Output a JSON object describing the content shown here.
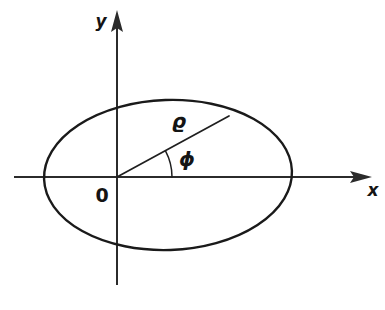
{
  "figure": {
    "kind": "geometry-diagram",
    "background_color": "#ffffff",
    "ink_color": "#1a1a1a"
  },
  "axes": {
    "x_axis": {
      "label": "x",
      "arrow_direction": "right",
      "start_x": 14,
      "end_x": 372,
      "y": 177
    },
    "y_axis": {
      "label": "y",
      "arrow_direction": "up",
      "start_y": 285,
      "end_y": 10,
      "x": 117
    },
    "origin_label": "0"
  },
  "ellipse": {
    "center_x": 168,
    "center_y": 175,
    "semi_major": 124,
    "semi_minor": 75,
    "rotation_deg": -2
  },
  "radius_vector": {
    "label": "ϱ",
    "from_x": 117,
    "from_y": 177,
    "to_x": 229,
    "to_y": 116
  },
  "angle": {
    "label": "ϕ",
    "arc_radius": 55,
    "arc_start_deg": 0,
    "arc_end_deg": 28
  },
  "labels": {
    "y": {
      "text": "y",
      "x": 101,
      "y": 22
    },
    "x": {
      "text": "x",
      "x": 373,
      "y": 191
    },
    "origin": {
      "text": "0",
      "x": 102,
      "y": 196
    },
    "rho": {
      "text": "ϱ",
      "x": 179,
      "y": 122
    },
    "phi": {
      "text": "ϕ",
      "x": 187,
      "y": 160
    }
  }
}
